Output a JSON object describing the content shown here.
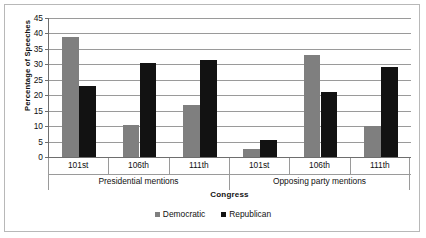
{
  "chart_data": {
    "type": "bar",
    "title": "",
    "xlabel": "Congress",
    "ylabel": "Percentage of Speeches",
    "ylim": [
      0,
      45
    ],
    "ytick_step": 5,
    "yticks": [
      45,
      40,
      35,
      30,
      25,
      20,
      15,
      10,
      5,
      0
    ],
    "grid": true,
    "legend_position": "bottom",
    "categories": [
      "101st",
      "106th",
      "111th",
      "101st",
      "106th",
      "111th"
    ],
    "groups": [
      {
        "label": "Presidential mentions",
        "categories": [
          "101st",
          "106th",
          "111th"
        ]
      },
      {
        "label": "Opposing party mentions",
        "categories": [
          "101st",
          "106th",
          "111th"
        ]
      }
    ],
    "series": [
      {
        "name": "Democratic",
        "color": "#7f7f7f",
        "values": [
          39,
          10.5,
          17,
          2.5,
          33,
          10
        ]
      },
      {
        "name": "Republican",
        "color": "#121212",
        "values": [
          23,
          30.5,
          31.5,
          5.5,
          21,
          29
        ]
      }
    ]
  },
  "legend": {
    "entries": [
      {
        "label": "Democratic",
        "swatch": "square-gray"
      },
      {
        "label": "Republican",
        "swatch": "square-black"
      }
    ]
  },
  "colors": {
    "democratic": "#7f7f7f",
    "republican": "#121212",
    "gridline": "#9a9a9a",
    "axis": "#6e6e6e",
    "frame": "#b8b8b8",
    "background": "#ffffff",
    "text": "#111111"
  }
}
